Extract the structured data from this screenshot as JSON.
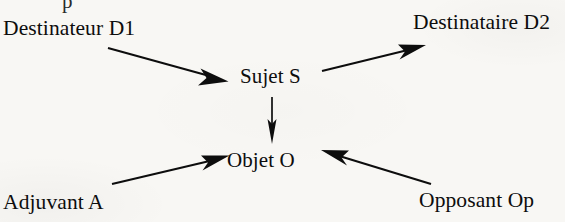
{
  "figure": {
    "background_color": "#f8f7f4",
    "ink_color": "#0d0d0d",
    "width": 565,
    "height": 222,
    "top_cut_fragment": "p"
  },
  "nodes": {
    "destinateur": {
      "label": "Destinateur D1",
      "x": 3,
      "y": 18
    },
    "destinataire": {
      "label": "Destinataire D2",
      "x": 413,
      "y": 12
    },
    "sujet": {
      "label": "Sujet S",
      "x": 240,
      "y": 66
    },
    "objet": {
      "label": "Objet O",
      "x": 227,
      "y": 150
    },
    "adjuvant": {
      "label": "Adjuvant A",
      "x": 3,
      "y": 192
    },
    "opposant": {
      "label": "Opposant Op",
      "x": 419,
      "y": 190
    }
  },
  "arrows": [
    {
      "name": "destinateur-to-sujet",
      "from": "Destinateur D1",
      "to": "Sujet S",
      "start": [
        108,
        48
      ],
      "end": [
        228,
        81
      ]
    },
    {
      "name": "sujet-to-destinataire",
      "from": "Sujet S",
      "to": "Destinataire D2",
      "start": [
        322,
        71
      ],
      "end": [
        426,
        45
      ]
    },
    {
      "name": "sujet-to-objet",
      "from": "Sujet S",
      "to": "Objet O",
      "start": [
        272,
        97
      ],
      "end": [
        272,
        144
      ]
    },
    {
      "name": "adjuvant-to-objet",
      "from": "Adjuvant A",
      "to": "Objet O",
      "start": [
        112,
        184
      ],
      "end": [
        229,
        155
      ]
    },
    {
      "name": "opposant-to-objet",
      "from": "Opposant Op",
      "to": "Objet O",
      "start": [
        431,
        184
      ],
      "end": [
        321,
        150
      ]
    }
  ]
}
